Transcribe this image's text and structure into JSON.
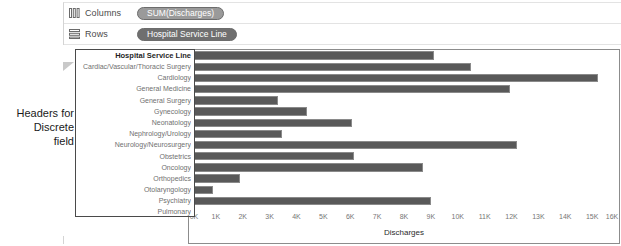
{
  "annotation": {
    "line1": "Headers for",
    "line2": "Discrete",
    "line3": "field"
  },
  "shelves": [
    {
      "label": "Columns",
      "icon": "columns-icon",
      "pill": "SUM(Discharges)",
      "pill_color": "#9a9a9a"
    },
    {
      "label": "Rows",
      "icon": "rows-icon",
      "pill": "Hospital Service Line",
      "pill_color": "#6f6f6f"
    }
  ],
  "viz": {
    "row_header_title": "Hospital Service Line",
    "marker_icon": "drag-handle-icon"
  },
  "chart_data": {
    "type": "bar",
    "orientation": "horizontal",
    "title": "",
    "xlabel": "Discharges",
    "ylabel": "Hospital Service Line",
    "xlim": [
      0,
      16000
    ],
    "grid": false,
    "legend": null,
    "bar_color": "#595959",
    "tick_labels": [
      "0K",
      "1K",
      "2K",
      "3K",
      "4K",
      "5K",
      "6K",
      "7K",
      "8K",
      "9K",
      "10K",
      "11K",
      "12K",
      "13K",
      "14K",
      "15K",
      "16K"
    ],
    "tick_values": [
      0,
      1000,
      2000,
      3000,
      4000,
      5000,
      6000,
      7000,
      8000,
      9000,
      10000,
      11000,
      12000,
      13000,
      14000,
      15000,
      16000
    ],
    "categories": [
      "Cardiac/Vascular/Thoracic Surgery",
      "Cardiology",
      "General Medicine",
      "General Surgery",
      "Gynecology",
      "Neonatology",
      "Nephrology/Urology",
      "Neurology/Neurosurgery",
      "Obstetrics",
      "Oncology",
      "Orthopedics",
      "Otolaryngology",
      "Psychiatry",
      "Pulmonary"
    ],
    "values": [
      9100,
      10500,
      15200,
      11950,
      3300,
      4400,
      6050,
      3450,
      12200,
      6150,
      8700,
      1900,
      900,
      9000
    ]
  }
}
